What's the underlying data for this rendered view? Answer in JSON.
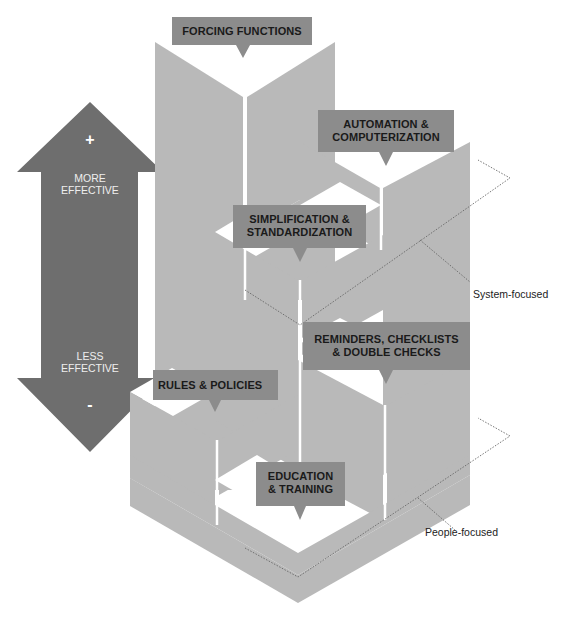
{
  "diagram": {
    "type": "hierarchy-of-effectiveness",
    "levels": [
      {
        "label": "FORCING FUNCTIONS",
        "rank": 1,
        "group": "System-focused"
      },
      {
        "label": "AUTOMATION & COMPUTERIZATION",
        "line1": "AUTOMATION &",
        "line2": "COMPUTERIZATION",
        "rank": 2,
        "group": "System-focused"
      },
      {
        "label": "SIMPLIFICATION & STANDARDIZATION",
        "line1": "SIMPLIFICATION &",
        "line2": "STANDARDIZATION",
        "rank": 3,
        "group": "System-focused"
      },
      {
        "label": "REMINDERS, CHECKLISTS & DOUBLE CHECKS",
        "line1": "REMINDERS, CHECKLISTS",
        "line2": "& DOUBLE CHECKS",
        "rank": 4,
        "group": "People-focused"
      },
      {
        "label": "RULES & POLICIES",
        "rank": 5,
        "group": "People-focused"
      },
      {
        "label": "EDUCATION & TRAINING",
        "line1": "EDUCATION",
        "line2": "& TRAINING",
        "rank": 6,
        "group": "People-focused"
      }
    ],
    "scale_arrow": {
      "top_sign": "+",
      "top_line1": "MORE",
      "top_line2": "EFFECTIVE",
      "bottom_line1": "LESS",
      "bottom_line2": "EFFECTIVE",
      "bottom_sign": "-"
    },
    "groups": {
      "system": "System-focused",
      "people": "People-focused"
    },
    "colors": {
      "arrow": "#6e6e6e",
      "block": "#b9b9b9",
      "label_box": "#8c8c8c",
      "background": "#ffffff"
    }
  }
}
